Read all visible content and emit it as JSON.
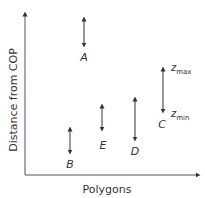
{
  "diagram": {
    "y_axis_label": "Distance from COP",
    "x_axis_label": "Polygons",
    "polygons": [
      {
        "name": "A",
        "x": 84,
        "top": 17,
        "bottom": 47,
        "label_y": 60
      },
      {
        "name": "B",
        "x": 70,
        "top": 127,
        "bottom": 154,
        "label_y": 167
      },
      {
        "name": "E",
        "x": 102,
        "top": 104,
        "bottom": 131,
        "label_y": 148
      },
      {
        "name": "D",
        "x": 135,
        "top": 97,
        "bottom": 141,
        "label_y": 154
      },
      {
        "name": "C",
        "x": 163,
        "top": 67,
        "bottom": 113,
        "label_y": 127
      }
    ],
    "annotations": {
      "zmax_base": "z",
      "zmax_sub": "max",
      "zmin_base": "z",
      "zmin_sub": "min"
    },
    "colors": {
      "line": "#333333",
      "text": "#333333",
      "axis": "#555555"
    }
  }
}
